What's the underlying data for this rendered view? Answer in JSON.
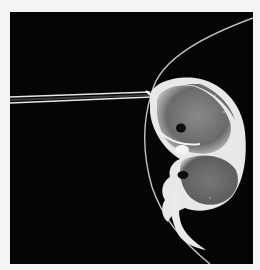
{
  "image": {
    "alt": "Micrograph of an embryo inside a membrane with a micropipette injecting from the left",
    "colors": {
      "background": "#050505",
      "page": "#f4f4f4",
      "membrane": "#d8d8d8",
      "pipette": "#e6e6e6",
      "embryo_body": "#7a7a7a",
      "embryo_highlight": "#f2f2f2",
      "embryo_dark": "#111111"
    }
  }
}
